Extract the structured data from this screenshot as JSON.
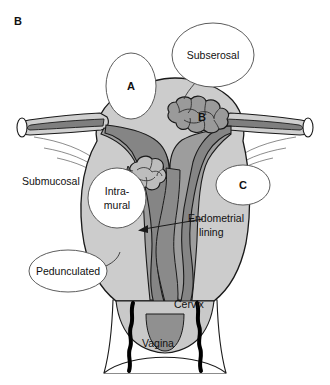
{
  "figure": {
    "panel_label": "B",
    "title_alt": "Uterine fibroid (leiomyoma) locations diagram"
  },
  "colors": {
    "background": "#ffffff",
    "outline": "#1a1a1a",
    "uterus_body": "#cccccc",
    "myometrium_wedge": "#a0a0a0",
    "endometrial_cavity": "#8c8c8c",
    "fibroid_fill": "#9a9a9a",
    "fibroid_highlight": "#c4c4c4",
    "tube_lumen": "#8f8f8f",
    "callout_fill": "#ffffff",
    "callout_stroke": "#4a4a4a",
    "vagina_wall": "#000000",
    "text": "#111111"
  },
  "callouts": [
    {
      "id": "callout-a",
      "label": "A",
      "shape": "ellipse",
      "cx": 131,
      "cy": 86,
      "rx": 25,
      "ry": 33
    },
    {
      "id": "callout-subserosal",
      "label": "Subserosal",
      "shape": "ellipse",
      "cx": 213,
      "cy": 55,
      "rx": 40,
      "ry": 32
    },
    {
      "id": "callout-b",
      "label": "B",
      "shape": "letter",
      "cx": 202,
      "cy": 117,
      "rx": 0,
      "ry": 0
    },
    {
      "id": "callout-c",
      "label": "C",
      "shape": "ellipse",
      "cx": 243,
      "cy": 185,
      "rx": 27,
      "ry": 20
    },
    {
      "id": "callout-intramural",
      "label": "Intra-mural",
      "shape": "ellipse",
      "cx": 117,
      "cy": 198,
      "rx": 29,
      "ry": 30
    },
    {
      "id": "callout-pedunculated",
      "label": "Pedunculated",
      "shape": "ellipse",
      "cx": 68,
      "cy": 271,
      "rx": 38,
      "ry": 21
    }
  ],
  "callout_text": {
    "a": "A",
    "b": "B",
    "c": "C",
    "subserosal": "Subserosal",
    "intramural_line1": "Intra-",
    "intramural_line2": "mural",
    "pedunculated": "Pedunculated"
  },
  "labels": {
    "submucosal": "Submucosal",
    "endometrial_line1": "Endometrial",
    "endometrial_line2": "lining",
    "cervix": "Cervix",
    "vagina": "Vagina"
  },
  "anatomy_parts": [
    "fallopian-tube-left",
    "fallopian-tube-right",
    "uterine-fundus",
    "myometrium",
    "endometrial-cavity",
    "broad-ligament-left",
    "broad-ligament-right",
    "cervix",
    "vagina"
  ],
  "fibroids": [
    {
      "name": "subserosal-fibroid",
      "marker": "B",
      "cx": 202,
      "cy": 117
    },
    {
      "name": "intramural-fibroid",
      "marker": "Intra-mural",
      "cx": 146,
      "cy": 182
    }
  ],
  "leaders": [
    {
      "name": "leader-submucosal",
      "from": "Submucosal label",
      "to": "submucosal region"
    },
    {
      "name": "leader-endometrial",
      "from": "Endometrial lining label",
      "to": "endometrial cavity",
      "arrow": true
    },
    {
      "name": "leader-pedunculated",
      "from": "Pedunculated ellipse",
      "to": "uterine serosa"
    },
    {
      "name": "leader-subserosal",
      "from": "Subserosal ellipse",
      "to": "fundal serosa"
    }
  ]
}
